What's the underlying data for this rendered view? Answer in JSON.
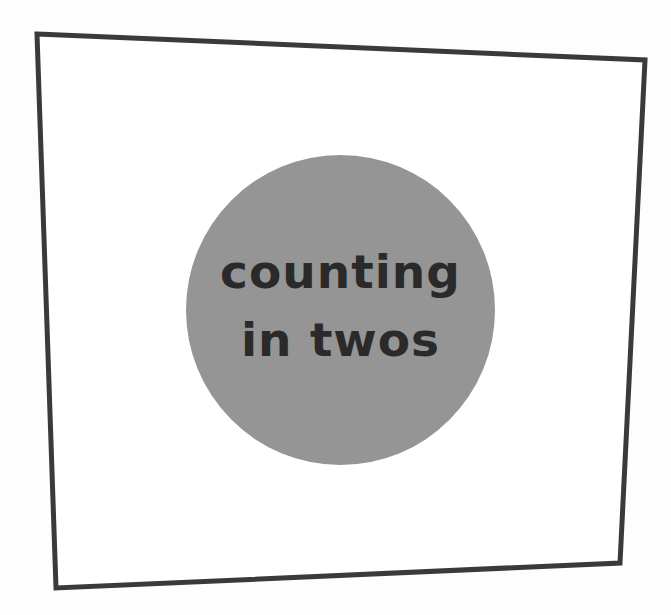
{
  "card": {
    "title_lines": [
      "counting",
      "in twos"
    ],
    "frame_color": "#3a3a3a",
    "badge_color": "#959595",
    "text_color": "#2a2a2a",
    "background": "#fdfdfd"
  }
}
